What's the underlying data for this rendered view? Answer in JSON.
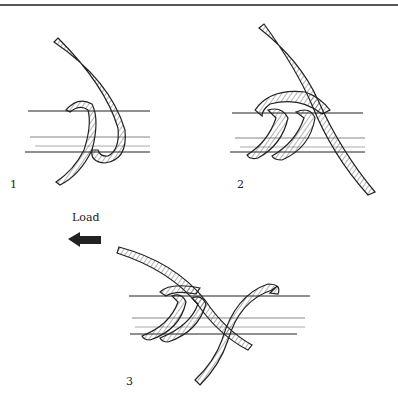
{
  "figure": {
    "steps": [
      {
        "number": "1"
      },
      {
        "number": "2"
      },
      {
        "number": "3"
      }
    ],
    "load_label": "Load",
    "load_arrow": "arrow-left-icon",
    "colors": {
      "line": "#222222",
      "rule": "#555555",
      "background": "#ffffff"
    }
  }
}
